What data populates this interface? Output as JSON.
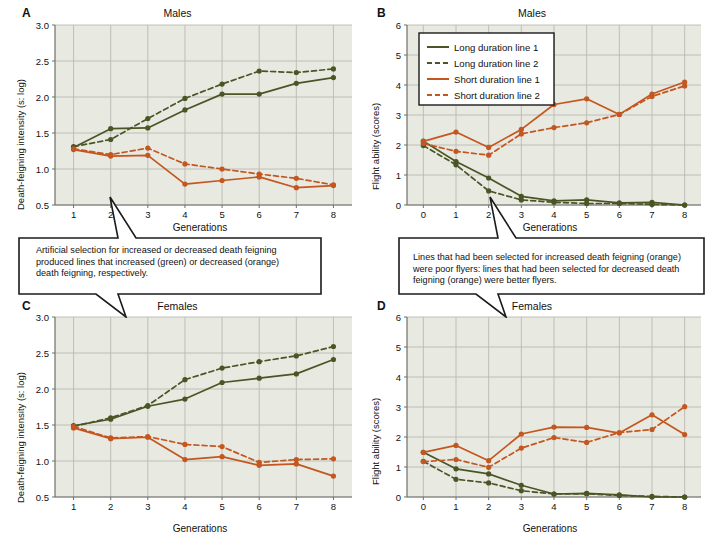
{
  "figure": {
    "background": "#ffffff",
    "plot_background": "#e8e9e1",
    "grid_color": "#b9bab2",
    "axis_color": "#6f6f68",
    "green": "#4a5526",
    "orange": "#c4561f"
  },
  "series_names": {
    "long1": "Long duration line 1",
    "long2": "Long duration line 2",
    "short1": "Short duration line 1",
    "short2": "Short duration line 2"
  },
  "panels": {
    "A": {
      "letter": "A",
      "title": "Males",
      "xlabel": "Generations",
      "ylabel": "Death-feigning intensity (s: log)",
      "yticks": [
        "3.0",
        "2.5",
        "2.0",
        "1.5",
        "1.0",
        "0.5"
      ],
      "xticks": [
        "1",
        "2",
        "3",
        "4",
        "5",
        "6",
        "7",
        "8"
      ]
    },
    "B": {
      "letter": "B",
      "title": "Males",
      "xlabel": "Generations",
      "ylabel": "Flight ability (scores)",
      "yticks": [
        "6",
        "5",
        "4",
        "3",
        "2",
        "1",
        "0"
      ],
      "xticks": [
        "0",
        "1",
        "2",
        "3",
        "4",
        "5",
        "6",
        "7",
        "8"
      ]
    },
    "C": {
      "letter": "C",
      "title": "Females",
      "xlabel": "Generations",
      "ylabel": "Death-feigning intensity (s: log)",
      "yticks": [
        "3.0",
        "2.5",
        "2.0",
        "1.5",
        "1.0",
        "0.5"
      ],
      "xticks": [
        "1",
        "2",
        "3",
        "4",
        "5",
        "6",
        "7",
        "8"
      ]
    },
    "D": {
      "letter": "D",
      "title": "Females",
      "xlabel": "Generations",
      "ylabel": "Flight ability (scores)",
      "yticks": [
        "6",
        "5",
        "4",
        "3",
        "2",
        "1",
        "0"
      ],
      "xticks": [
        "0",
        "1",
        "2",
        "3",
        "4",
        "5",
        "6",
        "7",
        "8"
      ]
    }
  },
  "callouts": {
    "left": {
      "text": "Artificial selection for increased or decreased death feigning produced lines that increased (green) or decreased (orange) death feigning, respectively."
    },
    "right": {
      "text": "Lines that had been selected for increased death feigning (orange) were poor flyers: lines that had been selected for decreased death feigning (orange) were better flyers."
    }
  },
  "chart_data": [
    {
      "panel": "A",
      "type": "line",
      "title": "Males",
      "xlabel": "Generations",
      "ylabel": "Death-feigning intensity (s: log)",
      "x": [
        1,
        2,
        3,
        4,
        5,
        6,
        7,
        8
      ],
      "xlim": [
        0.5,
        8.5
      ],
      "ylim": [
        0.5,
        3.0
      ],
      "grid": true,
      "legend": "none",
      "series": [
        {
          "name": "Long duration line 1",
          "color": "#4a5526",
          "dash": false,
          "values": [
            1.3,
            1.56,
            1.57,
            1.82,
            2.04,
            2.04,
            2.19,
            2.27
          ]
        },
        {
          "name": "Long duration line 2",
          "color": "#4a5526",
          "dash": true,
          "values": [
            1.31,
            1.41,
            1.7,
            1.98,
            2.18,
            2.36,
            2.34,
            2.39
          ]
        },
        {
          "name": "Short duration line 1",
          "color": "#c4561f",
          "dash": false,
          "values": [
            1.27,
            1.18,
            1.19,
            0.79,
            0.84,
            0.89,
            0.74,
            0.77
          ]
        },
        {
          "name": "Short duration line 2",
          "color": "#c4561f",
          "dash": true,
          "values": [
            1.28,
            1.2,
            1.29,
            1.07,
            1.0,
            0.93,
            0.87,
            0.78
          ]
        }
      ]
    },
    {
      "panel": "B",
      "type": "line",
      "title": "Males",
      "xlabel": "Generations",
      "ylabel": "Flight ability (scores)",
      "x": [
        0,
        1,
        2,
        3,
        4,
        5,
        6,
        7,
        8
      ],
      "xlim": [
        -0.5,
        8.5
      ],
      "ylim": [
        0,
        6
      ],
      "grid": true,
      "legend": "upper-left",
      "series": [
        {
          "name": "Long duration line 1",
          "color": "#4a5526",
          "dash": false,
          "values": [
            2.13,
            1.45,
            0.9,
            0.29,
            0.14,
            0.17,
            0.07,
            0.09,
            0.0
          ]
        },
        {
          "name": "Long duration line 2",
          "color": "#4a5526",
          "dash": true,
          "values": [
            1.98,
            1.34,
            0.47,
            0.17,
            0.09,
            0.05,
            0.05,
            0.02,
            0.0
          ]
        },
        {
          "name": "Short duration line 1",
          "color": "#c4561f",
          "dash": false,
          "values": [
            2.12,
            2.43,
            1.92,
            2.52,
            3.35,
            3.54,
            3.02,
            3.7,
            4.1
          ]
        },
        {
          "name": "Short duration line 2",
          "color": "#c4561f",
          "dash": true,
          "values": [
            2.05,
            1.79,
            1.66,
            2.37,
            2.58,
            2.74,
            3.02,
            3.62,
            3.97
          ]
        }
      ]
    },
    {
      "panel": "C",
      "type": "line",
      "title": "Females",
      "xlabel": "Generations",
      "ylabel": "Death-feigning intensity (s: log)",
      "x": [
        1,
        2,
        3,
        4,
        5,
        6,
        7,
        8
      ],
      "xlim": [
        0.5,
        8.5
      ],
      "ylim": [
        0.5,
        3.0
      ],
      "grid": true,
      "legend": "none",
      "series": [
        {
          "name": "Long duration line 1",
          "color": "#4a5526",
          "dash": false,
          "values": [
            1.49,
            1.58,
            1.76,
            1.86,
            2.09,
            2.15,
            2.21,
            2.41
          ]
        },
        {
          "name": "Long duration line 2",
          "color": "#4a5526",
          "dash": true,
          "values": [
            1.48,
            1.6,
            1.77,
            2.13,
            2.29,
            2.38,
            2.46,
            2.59
          ]
        },
        {
          "name": "Short duration line 1",
          "color": "#c4561f",
          "dash": false,
          "values": [
            1.46,
            1.31,
            1.33,
            1.02,
            1.06,
            0.94,
            0.96,
            0.79
          ]
        },
        {
          "name": "Short duration line 2",
          "color": "#c4561f",
          "dash": true,
          "values": [
            1.48,
            1.32,
            1.34,
            1.23,
            1.2,
            0.98,
            1.02,
            1.03
          ]
        }
      ]
    },
    {
      "panel": "D",
      "type": "line",
      "title": "Females",
      "xlabel": "Generations",
      "ylabel": "Flight ability (scores)",
      "x": [
        0,
        1,
        2,
        3,
        4,
        5,
        6,
        7,
        8
      ],
      "xlim": [
        -0.5,
        8.5
      ],
      "ylim": [
        0,
        6
      ],
      "grid": true,
      "legend": "none",
      "series": [
        {
          "name": "Long duration line 1",
          "color": "#4a5526",
          "dash": false,
          "values": [
            1.49,
            0.94,
            0.77,
            0.39,
            0.1,
            0.12,
            0.07,
            0.0,
            0.0
          ]
        },
        {
          "name": "Long duration line 2",
          "color": "#4a5526",
          "dash": true,
          "values": [
            1.19,
            0.59,
            0.47,
            0.21,
            0.1,
            0.11,
            0.05,
            0.02,
            0.0
          ]
        },
        {
          "name": "Short duration line 1",
          "color": "#c4561f",
          "dash": false,
          "values": [
            1.49,
            1.72,
            1.21,
            2.1,
            2.33,
            2.32,
            2.13,
            2.74,
            2.08
          ]
        },
        {
          "name": "Short duration line 2",
          "color": "#c4561f",
          "dash": true,
          "values": [
            1.18,
            1.25,
            0.99,
            1.63,
            1.98,
            1.82,
            2.15,
            2.25,
            3.01
          ]
        }
      ]
    }
  ]
}
